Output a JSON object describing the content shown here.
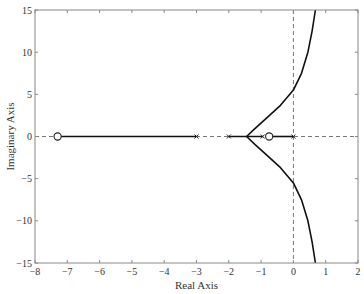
{
  "chart_data": {
    "type": "line",
    "title": "",
    "xlabel": "Real Axis",
    "ylabel": "Imaginary Axis",
    "xlim": [
      -8,
      2
    ],
    "ylim": [
      -15,
      15
    ],
    "xticks": [
      -8,
      -7,
      -6,
      -5,
      -4,
      -3,
      -2,
      -1,
      0,
      1,
      2
    ],
    "yticks": [
      -15,
      -10,
      -5,
      0,
      5,
      10,
      15
    ],
    "grid": false,
    "reference_lines": [
      {
        "orientation": "horizontal",
        "value": 0,
        "style": "dashed"
      },
      {
        "orientation": "vertical",
        "value": 0,
        "style": "dashed"
      }
    ],
    "poles": [
      {
        "re": 0,
        "im": 0
      },
      {
        "re": -0.95,
        "im": 0
      },
      {
        "re": -2,
        "im": 0
      },
      {
        "re": -3,
        "im": 0
      }
    ],
    "zeros": [
      {
        "re": -7.3,
        "im": 0
      },
      {
        "re": -0.75,
        "im": 0
      }
    ],
    "series": [
      {
        "name": "real-axis-segment-1",
        "x": [
          -7.3,
          -3
        ],
        "y": [
          0,
          0
        ]
      },
      {
        "name": "real-axis-segment-2",
        "x": [
          -2,
          -0.95
        ],
        "y": [
          0,
          0
        ]
      },
      {
        "name": "real-axis-segment-3",
        "x": [
          -0.75,
          0
        ],
        "y": [
          0,
          0
        ]
      },
      {
        "name": "upper-branch",
        "x": [
          -1.45,
          -1.2,
          -0.8,
          -0.4,
          0,
          0.25,
          0.45,
          0.58,
          0.68
        ],
        "y": [
          0,
          0.9,
          2.3,
          3.7,
          5.5,
          7.5,
          10,
          12.5,
          15
        ]
      },
      {
        "name": "lower-branch",
        "x": [
          -1.45,
          -1.2,
          -0.8,
          -0.4,
          0,
          0.25,
          0.45,
          0.58,
          0.68
        ],
        "y": [
          0,
          -0.9,
          -2.3,
          -3.7,
          -5.5,
          -7.5,
          -10,
          -12.5,
          -15
        ]
      }
    ],
    "annotations": []
  },
  "layout": {
    "plot": {
      "left": 35,
      "top": 10,
      "right": 358,
      "bottom": 263
    }
  }
}
